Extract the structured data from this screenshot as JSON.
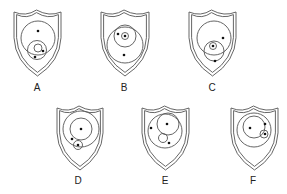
{
  "figure": {
    "width": 287,
    "height": 194,
    "stroke_color": "#555555",
    "dot_color": "#111111",
    "shields": [
      {
        "label": "A",
        "box": {
          "x": 14,
          "y": 10,
          "w": 47,
          "h": 66
        },
        "label_pos": {
          "x": 37,
          "y": 91
        },
        "circles": [
          {
            "cx": 38,
            "cy": 38,
            "r": 17
          },
          {
            "cx": 37,
            "cy": 50,
            "r": 9.5
          },
          {
            "cx": 38,
            "cy": 48,
            "r": 4
          }
        ],
        "dots": [
          {
            "cx": 38,
            "cy": 31
          },
          {
            "cx": 43,
            "cy": 51
          },
          {
            "cx": 35,
            "cy": 57
          }
        ]
      },
      {
        "label": "B",
        "box": {
          "x": 101,
          "y": 10,
          "w": 48,
          "h": 66
        },
        "label_pos": {
          "x": 124,
          "y": 91
        },
        "circles": [
          {
            "cx": 125,
            "cy": 45,
            "r": 18
          },
          {
            "cx": 125,
            "cy": 36,
            "r": 11
          },
          {
            "cx": 125,
            "cy": 36,
            "r": 3.5
          }
        ],
        "dots": [
          {
            "cx": 118,
            "cy": 34
          },
          {
            "cx": 125,
            "cy": 36
          },
          {
            "cx": 124,
            "cy": 55
          }
        ]
      },
      {
        "label": "C",
        "box": {
          "x": 189,
          "y": 10,
          "w": 47,
          "h": 66
        },
        "label_pos": {
          "x": 212,
          "y": 91
        },
        "circles": [
          {
            "cx": 214,
            "cy": 38,
            "r": 17
          },
          {
            "cx": 214,
            "cy": 51,
            "r": 10
          },
          {
            "cx": 213,
            "cy": 46,
            "r": 3.5
          }
        ],
        "dots": [
          {
            "cx": 223,
            "cy": 38
          },
          {
            "cx": 213,
            "cy": 46
          },
          {
            "cx": 215,
            "cy": 61
          }
        ]
      },
      {
        "label": "D",
        "box": {
          "x": 57,
          "y": 106,
          "w": 46,
          "h": 64
        },
        "label_pos": {
          "x": 78,
          "y": 184
        },
        "circles": [
          {
            "cx": 81,
            "cy": 129,
            "r": 18
          },
          {
            "cx": 81,
            "cy": 129,
            "r": 11
          },
          {
            "cx": 78,
            "cy": 145,
            "r": 4.5
          }
        ],
        "dots": [
          {
            "cx": 81,
            "cy": 129
          },
          {
            "cx": 72,
            "cy": 139
          },
          {
            "cx": 78,
            "cy": 145
          }
        ]
      },
      {
        "label": "E",
        "box": {
          "x": 142,
          "y": 106,
          "w": 47,
          "h": 64
        },
        "label_pos": {
          "x": 165,
          "y": 184
        },
        "circles": [
          {
            "cx": 165,
            "cy": 131,
            "r": 17
          },
          {
            "cx": 168,
            "cy": 124,
            "r": 11
          },
          {
            "cx": 163,
            "cy": 138,
            "r": 4.5
          }
        ],
        "dots": [
          {
            "cx": 151,
            "cy": 128
          },
          {
            "cx": 167,
            "cy": 124
          },
          {
            "cx": 169,
            "cy": 143
          }
        ]
      },
      {
        "label": "F",
        "box": {
          "x": 231,
          "y": 106,
          "w": 47,
          "h": 64
        },
        "label_pos": {
          "x": 253,
          "y": 184
        },
        "circles": [
          {
            "cx": 254,
            "cy": 130,
            "r": 17
          },
          {
            "cx": 254,
            "cy": 127,
            "r": 11
          },
          {
            "cx": 264,
            "cy": 134,
            "r": 4
          }
        ],
        "dots": [
          {
            "cx": 250,
            "cy": 128
          },
          {
            "cx": 265,
            "cy": 124
          },
          {
            "cx": 265,
            "cy": 134
          }
        ]
      }
    ]
  }
}
